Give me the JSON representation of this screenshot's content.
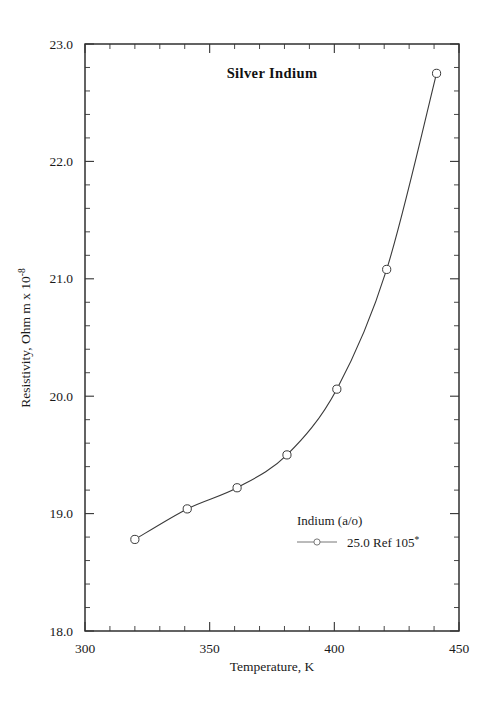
{
  "chart_data": {
    "type": "line",
    "title": "Silver  Indium",
    "xlabel": "Temperature,  K",
    "ylabel_parts": {
      "main": "Resistivity, Ohm m x 10",
      "exponent": "-8"
    },
    "xlim": [
      300,
      450
    ],
    "ylim": [
      18.0,
      23.0
    ],
    "xticks": [
      300,
      350,
      400,
      450
    ],
    "xtick_labels": [
      "300",
      "350",
      "400",
      "450"
    ],
    "yticks": [
      18.0,
      19.0,
      20.0,
      21.0,
      22.0,
      23.0
    ],
    "ytick_labels": [
      "18.0",
      "19.0",
      "20.0",
      "21.0",
      "22.0",
      "23.0"
    ],
    "x_minor_step": 10,
    "y_minor_step": 0.2,
    "grid": false,
    "legend_position": "inside-lower-right",
    "legend_title": "Indium (a/o)",
    "series": [
      {
        "name": "25.0 Ref 105*",
        "label_text": "25.0 Ref 105",
        "label_superscript": "*",
        "marker": "open-circle",
        "color": "#3a3a3a",
        "x": [
          320,
          341,
          361,
          381,
          401,
          421,
          441
        ],
        "values": [
          18.78,
          19.04,
          19.22,
          19.5,
          20.06,
          21.08,
          22.75
        ]
      }
    ]
  },
  "axes": {
    "frame_color": "#222222",
    "tick_color": "#333333"
  }
}
